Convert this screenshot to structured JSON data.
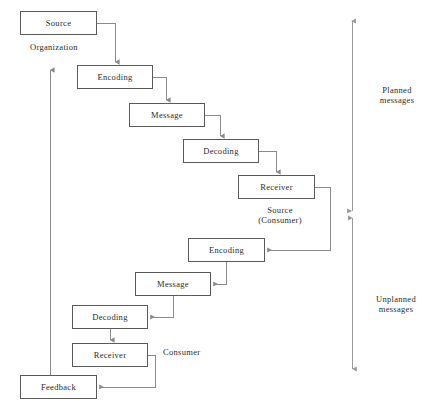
{
  "diagram": {
    "background_color": "#ffffff",
    "box_border_color": "#5a5a5a",
    "connector_color": "#8a8a8a",
    "text_color": "#2b2b2b",
    "nodes": [
      {
        "id": "source",
        "label": "Source",
        "x": 20,
        "y": 11,
        "w": 77,
        "h": 24
      },
      {
        "id": "encoding-top",
        "label": "Encoding",
        "x": 77,
        "y": 65,
        "w": 76,
        "h": 24
      },
      {
        "id": "message-top",
        "label": "Message",
        "x": 129,
        "y": 103,
        "w": 76,
        "h": 24
      },
      {
        "id": "decoding-top",
        "label": "Decoding",
        "x": 183,
        "y": 139,
        "w": 76,
        "h": 24
      },
      {
        "id": "receiver-top",
        "label": "Receiver",
        "x": 238,
        "y": 175,
        "w": 77,
        "h": 24
      },
      {
        "id": "encoding-bottom",
        "label": "Encoding",
        "x": 188,
        "y": 238,
        "w": 77,
        "h": 24
      },
      {
        "id": "message-bottom",
        "label": "Message",
        "x": 135,
        "y": 272,
        "w": 76,
        "h": 24
      },
      {
        "id": "decoding-bottom",
        "label": "Decoding",
        "x": 72,
        "y": 305,
        "w": 76,
        "h": 24
      },
      {
        "id": "receiver-bottom",
        "label": "Receiver",
        "x": 72,
        "y": 343,
        "w": 76,
        "h": 24
      },
      {
        "id": "feedback",
        "label": "Feedback",
        "x": 20,
        "y": 375,
        "w": 77,
        "h": 24
      }
    ],
    "annotations": [
      {
        "id": "organization",
        "text": "Organization",
        "x": 30,
        "y": 44,
        "align": "left"
      },
      {
        "id": "source-consumer",
        "text": "Source\n(Consumer)",
        "x": 250,
        "y": 206,
        "align": "center"
      },
      {
        "id": "consumer",
        "text": "Consumer",
        "x": 163,
        "y": 348,
        "align": "left"
      },
      {
        "id": "planned-messages",
        "text": "Planned\nmessages",
        "x": 375,
        "y": 86,
        "align": "center"
      },
      {
        "id": "unplanned-messages",
        "text": "Unplanned\nmessages",
        "x": 372,
        "y": 296,
        "align": "center"
      }
    ],
    "brackets": [
      {
        "id": "planned-bracket",
        "x": 352,
        "y_top": 18,
        "y_bottom": 211,
        "label": "Planned messages"
      },
      {
        "id": "unplanned-bracket",
        "x": 352,
        "y_top": 218,
        "y_bottom": 372,
        "label": "Unplanned messages"
      }
    ],
    "feedback_arrow": {
      "id": "feedback-return-arrow",
      "x": 50,
      "y_top": 67,
      "y_bottom": 375
    },
    "flow_sequence": [
      "Source",
      "Encoding",
      "Message",
      "Decoding",
      "Receiver",
      "Encoding",
      "Message",
      "Decoding",
      "Receiver",
      "Feedback"
    ]
  }
}
